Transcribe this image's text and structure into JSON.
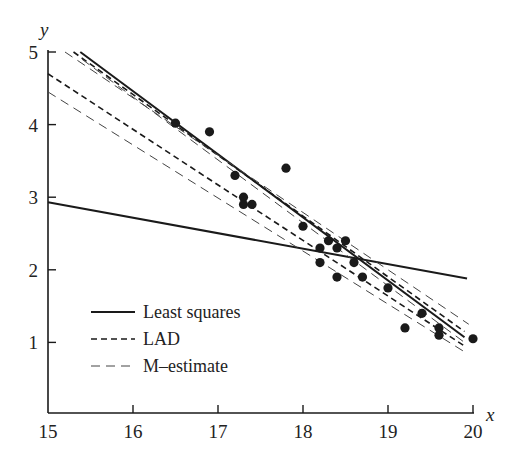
{
  "chart_data": {
    "type": "scatter",
    "title": "",
    "xlabel": "x",
    "ylabel": "y",
    "xlim": [
      15,
      20
    ],
    "ylim": [
      0,
      5
    ],
    "xticks": [
      15,
      16,
      17,
      18,
      19,
      20
    ],
    "yticks": [
      1,
      2,
      3,
      4,
      5
    ],
    "grid": false,
    "legend_position": "lower-left",
    "points": [
      [
        16.5,
        4.02
      ],
      [
        16.9,
        3.9
      ],
      [
        17.2,
        3.3
      ],
      [
        17.3,
        3.0
      ],
      [
        17.3,
        2.9
      ],
      [
        17.4,
        2.9
      ],
      [
        17.8,
        3.4
      ],
      [
        18.0,
        2.6
      ],
      [
        18.2,
        2.3
      ],
      [
        18.2,
        2.1
      ],
      [
        18.3,
        2.4
      ],
      [
        18.4,
        2.3
      ],
      [
        18.4,
        1.9
      ],
      [
        18.5,
        2.4
      ],
      [
        18.6,
        2.1
      ],
      [
        18.7,
        1.9
      ],
      [
        19.0,
        1.75
      ],
      [
        19.2,
        1.2
      ],
      [
        19.4,
        1.4
      ],
      [
        19.6,
        1.2
      ],
      [
        19.6,
        1.1
      ],
      [
        20.0,
        1.05
      ]
    ],
    "series": [
      {
        "name": "Least squares",
        "style": "solid",
        "lines": [
          [
            [
              15.0,
              2.93
            ],
            [
              19.93,
              1.88
            ]
          ],
          [
            [
              15.38,
              5.0
            ],
            [
              19.9,
              1.07
            ]
          ]
        ]
      },
      {
        "name": "LAD",
        "style": "dashed",
        "lines": [
          [
            [
              15.0,
              4.7
            ],
            [
              19.9,
              0.95
            ]
          ],
          [
            [
              15.3,
              5.0
            ],
            [
              19.9,
              1.15
            ]
          ]
        ]
      },
      {
        "name": "M-estimate",
        "style": "light-dashed",
        "lines": [
          [
            [
              15.0,
              4.45
            ],
            [
              19.9,
              0.87
            ]
          ],
          [
            [
              15.2,
              5.0
            ],
            [
              19.95,
              1.25
            ]
          ],
          [
            [
              15.4,
              4.9
            ],
            [
              19.9,
              1.0
            ]
          ]
        ]
      }
    ]
  },
  "legend": {
    "items": [
      {
        "label": "Least squares",
        "style": "solid"
      },
      {
        "label": "LAD",
        "style": "dashed"
      },
      {
        "label": "M–estimate",
        "style": "light-dashed"
      }
    ]
  },
  "axes": {
    "x_var": "x",
    "y_var": "y",
    "x_tick_labels": [
      "15",
      "16",
      "17",
      "18",
      "19",
      "20"
    ],
    "y_tick_labels": [
      "1",
      "2",
      "3",
      "4",
      "5"
    ]
  },
  "colors": {
    "ink": "#1a1a1a",
    "background": "#ffffff"
  }
}
